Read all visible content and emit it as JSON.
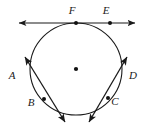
{
  "figure": {
    "type": "geometry-diagram",
    "stroke_color": "#1a1a1a",
    "background_color": "#ffffff",
    "circle": {
      "center_x": 76,
      "center_y": 69,
      "radius": 46,
      "center_dot_label": ""
    },
    "labels": [
      {
        "id": "A",
        "text": "A",
        "x": 12,
        "y": 76
      },
      {
        "id": "B",
        "text": "B",
        "x": 30,
        "y": 106
      },
      {
        "id": "C",
        "text": "C",
        "x": 113,
        "y": 105
      },
      {
        "id": "D",
        "text": "D",
        "x": 129,
        "y": 76
      },
      {
        "id": "E",
        "text": "E",
        "x": 106,
        "y": 14
      },
      {
        "id": "F",
        "text": "F",
        "x": 72,
        "y": 14
      }
    ],
    "points": [
      {
        "id": "F",
        "x": 76,
        "y": 23
      },
      {
        "id": "E",
        "x": 110,
        "y": 23
      },
      {
        "id": "B",
        "x": 44,
        "y": 99
      },
      {
        "id": "C",
        "x": 108,
        "y": 98
      },
      {
        "id": "center",
        "x": 76,
        "y": 69
      }
    ],
    "lines": [
      {
        "id": "line-FE",
        "from_x": 15,
        "from_y": 23,
        "to_x": 139,
        "to_y": 23,
        "arrows": "both"
      },
      {
        "id": "line-AB",
        "from_x": 22,
        "from_y": 57,
        "to_x": 68,
        "to_y": 126,
        "arrows": "both"
      },
      {
        "id": "line-CD",
        "from_x": 130,
        "from_y": 57,
        "to_x": 86,
        "to_y": 126,
        "arrows": "both"
      }
    ]
  }
}
